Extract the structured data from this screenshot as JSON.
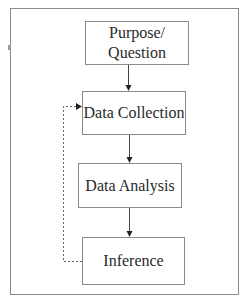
{
  "diagram": {
    "type": "flowchart",
    "nodes": [
      {
        "id": "purpose",
        "label_line1": "Purpose/",
        "label_line2": "Question"
      },
      {
        "id": "collection",
        "label": "Data Collection"
      },
      {
        "id": "analysis",
        "label": "Data Analysis"
      },
      {
        "id": "inference",
        "label": "Inference"
      }
    ],
    "edges": [
      {
        "from": "purpose",
        "to": "collection",
        "style": "solid"
      },
      {
        "from": "collection",
        "to": "analysis",
        "style": "solid"
      },
      {
        "from": "analysis",
        "to": "inference",
        "style": "solid"
      },
      {
        "from": "inference",
        "to": "collection",
        "style": "dashed",
        "route": "left-loop"
      }
    ],
    "colors": {
      "border": "#8a8a8a",
      "text": "#2a2a2a",
      "arrow": "#333333",
      "background": "#ffffff"
    }
  }
}
